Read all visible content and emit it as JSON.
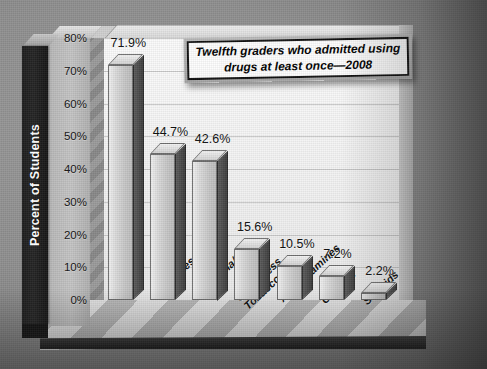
{
  "chart_data": {
    "type": "bar",
    "title": "Twelfth graders who admitted using drugs at least once—2008",
    "title_line1": "Twelfth graders who admitted using",
    "title_line2": "drugs at least once—2008",
    "xlabel": "",
    "ylabel": "Percent of Students",
    "ylim": [
      0,
      80
    ],
    "ytick_step": 10,
    "grid": true,
    "legend": "none",
    "categories": [
      "Alcohol",
      "Cigarettes",
      "Marijuana/Hash",
      "Smokeless Tobacco",
      "Amphetamines",
      "Cocaine",
      "Steroids"
    ],
    "category_lines": [
      [
        "Alcohol"
      ],
      [
        "Cigarettes"
      ],
      [
        "Marijuana/Hash"
      ],
      [
        "Smokeless",
        "Tobacco"
      ],
      [
        "Amphetamines"
      ],
      [
        "Cocaine"
      ],
      [
        "Steroids"
      ]
    ],
    "values": [
      71.9,
      44.7,
      42.6,
      15.6,
      10.5,
      7.2,
      2.2
    ],
    "value_labels": [
      "71.9%",
      "44.7%",
      "42.6%",
      "15.6%",
      "10.5%",
      "7.2%",
      "2.2%"
    ],
    "ytick_labels": [
      "80%",
      "70%",
      "60%",
      "50%",
      "40%",
      "30%",
      "20%",
      "10%",
      "0%"
    ],
    "ytick_values": [
      80,
      70,
      60,
      50,
      40,
      30,
      20,
      10,
      0
    ],
    "colors": {
      "bar_face": "#d9d9d9",
      "bar_side": "#4a4a4a",
      "bar_top": "#e4e4e4",
      "plot_background": "#f7f7f7",
      "gridline": "#c9c9c9",
      "axis_panel": "#1d1d1d",
      "axis_title_text": "#ffffff",
      "floor": "#c4c4c4",
      "page_background": "#8e8e8e",
      "title_box_fill": "#fdfdfd",
      "title_box_border": "#101010"
    }
  }
}
